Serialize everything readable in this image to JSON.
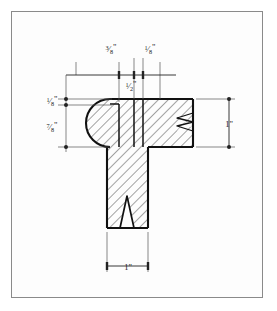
{
  "drawing": {
    "title": "Molding Cross-Section",
    "subject": "T-shaped wood molding profile",
    "view": "section",
    "hatching": "diagonal-section-lines",
    "colors": {
      "page_background": "#ffffff",
      "plate_background": "#fdfdfd",
      "plate_border": "#8a8a8a",
      "outline": "#111111",
      "hatch": "#333333",
      "dimension_line": "#222222",
      "text": "#1a1a1a"
    }
  },
  "dimensions": {
    "top_left_segment": {
      "label": "3/8\"",
      "numerator": "3",
      "denominator": "8",
      "unit": "\"",
      "position": "top",
      "value": 0.375
    },
    "top_right_segment": {
      "label": "1/8\"",
      "numerator": "1",
      "denominator": "8",
      "unit": "\"",
      "position": "top",
      "value": 0.125
    },
    "top_overall": {
      "label": "1/2\"",
      "numerator": "1",
      "denominator": "2",
      "unit": "\"",
      "position": "top-inner",
      "value": 0.5
    },
    "left_upper": {
      "label": "1/8\"",
      "numerator": "1",
      "denominator": "8",
      "unit": "\"",
      "position": "left",
      "value": 0.125
    },
    "left_lower": {
      "label": "7/8\"",
      "numerator": "7",
      "denominator": "8",
      "unit": "\"",
      "position": "left",
      "value": 0.875
    },
    "right_height": {
      "label": "1\"",
      "whole": "1",
      "unit": "\"",
      "position": "right",
      "value": 1
    },
    "bottom_width": {
      "label": "1\"",
      "whole": "1",
      "unit": "\"",
      "position": "bottom",
      "value": 1
    }
  },
  "features": {
    "bullnose_edge": "rounded left end",
    "break_line_right": "zigzag break",
    "break_line_bottom": "v-shaped break",
    "stem": "vertical web",
    "flange": "horizontal head"
  }
}
